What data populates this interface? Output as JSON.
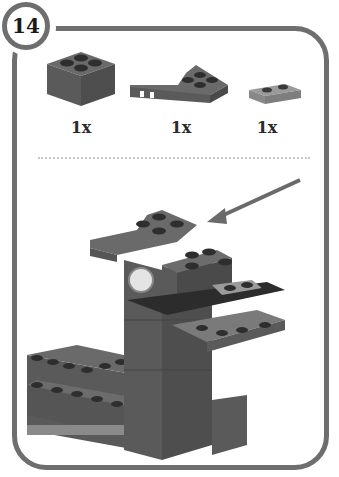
{
  "step": {
    "number": "14"
  },
  "parts": [
    {
      "name": "brick-2x2",
      "quantity": "1x",
      "color": "#5a5a5a"
    },
    {
      "name": "wedge-plate-3x2",
      "quantity": "1x",
      "color": "#5f5f5f"
    },
    {
      "name": "plate-1x2",
      "quantity": "1x",
      "color": "#8a8a8a"
    }
  ],
  "colors": {
    "frame": "#6e6e6e",
    "brick_dark": "#4a4a4a",
    "brick_mid": "#5e5e5e",
    "brick_light": "#8a8a8a",
    "arrow": "#6a6a6a"
  }
}
